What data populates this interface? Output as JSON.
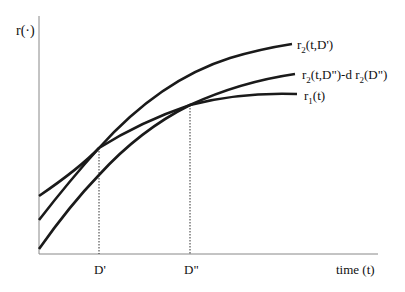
{
  "diagram": {
    "y_axis_label": "r(·)",
    "x_axis_label": "time (t)",
    "x_ticks": [
      {
        "label": "D'",
        "x": 99
      },
      {
        "label": "D\"",
        "x": 190
      }
    ],
    "curves": [
      {
        "id": "r2_t_Dprime",
        "label_base": "r",
        "label_sub": "2",
        "label_rest": "(t,D')"
      },
      {
        "id": "r2_t_Ddouble_minus",
        "label_base": "r",
        "label_sub": "2",
        "label_rest": "(t,D\")-d r",
        "label_sub2": "2",
        "label_rest2": "(D\")"
      },
      {
        "id": "r1_t",
        "label_base": "r",
        "label_sub": "1",
        "label_rest": "(t)"
      }
    ],
    "colors": {
      "curve": "#1a1a1a",
      "axis": "#777777",
      "guide": "#333333"
    }
  }
}
